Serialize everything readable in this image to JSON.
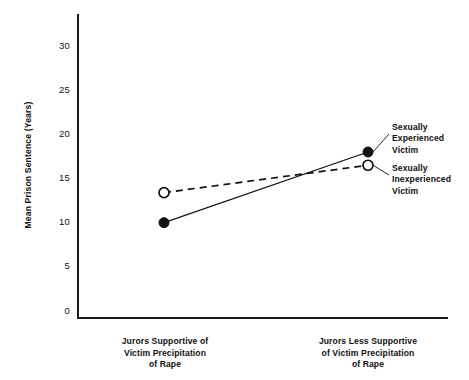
{
  "chart_data": {
    "type": "line",
    "title": "",
    "xlabel": "",
    "ylabel": "Mean Prison Sentence (Years)",
    "categories": [
      "Jurors Supportive of Victim Precipitation of Rape",
      "Jurors Less Supportive of Victim Precipitation of Rape"
    ],
    "category_lines": [
      [
        "Jurors Supportive of",
        "Victim Precipitation",
        "of Rape"
      ],
      [
        "Jurors Less Supportive",
        "of Victim Precipitation",
        "of Rape"
      ]
    ],
    "series": [
      {
        "name": "Sexually Experienced Victim",
        "name_lines": [
          "Sexually",
          "Experienced",
          "Victim"
        ],
        "marker": "filled-circle",
        "linestyle": "solid",
        "values": [
          10.0,
          18.0
        ]
      },
      {
        "name": "Sexually Inexperienced Victim",
        "name_lines": [
          "Sexually",
          "Inexperienced",
          "Victim"
        ],
        "marker": "open-circle",
        "linestyle": "dashed",
        "values": [
          13.4,
          16.5
        ]
      }
    ],
    "ylim": [
      0,
      33
    ],
    "yticks": [
      0,
      5,
      10,
      15,
      20,
      25,
      30
    ],
    "ytick_labels": [
      "0",
      "5",
      "10",
      "15",
      "20",
      "25",
      "30"
    ],
    "grid": false,
    "legend_position": "right-of-data"
  },
  "colors": {
    "ink": "#111111",
    "axis": "#1a1a1a",
    "background": "#ffffff"
  }
}
